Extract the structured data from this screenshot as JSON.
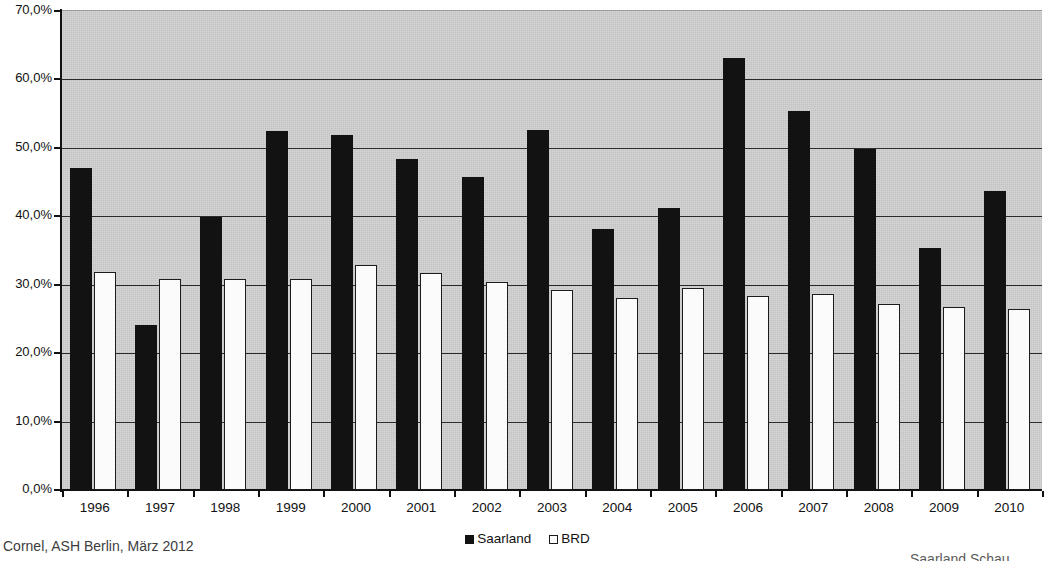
{
  "chart_data": {
    "type": "bar",
    "title": "",
    "xlabel": "",
    "ylabel": "",
    "ylim": [
      0,
      70
    ],
    "ytick_labels": [
      "0,0%",
      "10,0%",
      "20,0%",
      "30,0%",
      "40,0%",
      "50,0%",
      "60,0%",
      "70,0%"
    ],
    "ytick_values": [
      0,
      10,
      20,
      30,
      40,
      50,
      60,
      70
    ],
    "grid": "horizontal",
    "legend_position": "bottom-center",
    "categories": [
      "1996",
      "1997",
      "1998",
      "1999",
      "2000",
      "2001",
      "2002",
      "2003",
      "2004",
      "2005",
      "2006",
      "2007",
      "2008",
      "2009",
      "2010"
    ],
    "series": [
      {
        "name": "Saarland",
        "color": "#121212",
        "values": [
          47.1,
          24.1,
          39.9,
          52.4,
          51.9,
          48.4,
          45.7,
          52.6,
          38.1,
          41.2,
          63.2,
          55.4,
          49.9,
          35.4,
          43.7
        ]
      },
      {
        "name": "BRD",
        "color": "#fbfbfb",
        "values": [
          31.9,
          30.9,
          30.9,
          30.9,
          32.9,
          31.7,
          30.4,
          29.2,
          28.0,
          29.5,
          28.4,
          28.6,
          27.2,
          26.8,
          26.4
        ]
      }
    ]
  },
  "legend": {
    "entries": [
      {
        "label": "Saarland",
        "swatch": "filled-square-icon"
      },
      {
        "label": "BRD",
        "swatch": "outlined-square-icon"
      }
    ]
  },
  "footer": {
    "left": "Cornel, ASH Berlin, März 2012",
    "right": "Saarland Schau"
  }
}
